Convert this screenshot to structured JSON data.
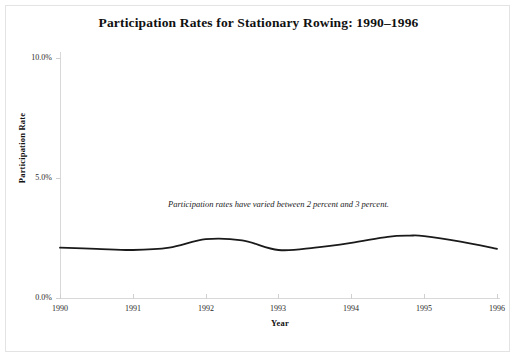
{
  "chart_data": {
    "type": "line",
    "title": "Participation Rates for Stationary Rowing: 1990–1996",
    "xlabel": "Year",
    "ylabel": "Participation Rate",
    "xlim": [
      1990,
      1996
    ],
    "ylim": [
      0,
      10
    ],
    "grid": false,
    "legend": null,
    "x_tick_labels": [
      "1990",
      "1991",
      "1992",
      "1993",
      "1994",
      "1995",
      "1996"
    ],
    "y_tick_labels": [
      "0.0%",
      "5.0%",
      "10.0%"
    ],
    "y_tick_values": [
      0,
      5,
      10
    ],
    "annotations": [
      {
        "text": "Participation rates have varied between 2 percent and 3 percent.",
        "x": 1993,
        "y": 4.1,
        "style": "italic"
      }
    ],
    "series": [
      {
        "name": "Stationary rowing participation rate",
        "units": "percent",
        "line_color": "#1a1a1a",
        "line_width": 1.8,
        "x": [
          1990,
          1990.5,
          1991,
          1991.5,
          1992,
          1992.5,
          1993,
          1993.5,
          1994,
          1994.5,
          1994.8,
          1995,
          1995.5,
          1996
        ],
        "values": [
          2.1,
          2.05,
          2.0,
          2.1,
          2.45,
          2.4,
          2.0,
          2.1,
          2.3,
          2.55,
          2.6,
          2.58,
          2.35,
          2.05
        ]
      }
    ]
  },
  "page": {
    "title": "Participation Rates for Stationary Rowing: 1990–1996",
    "xlabel": "Year",
    "ylabel": "Participation Rate",
    "annotation": "Participation rates have varied between 2 percent and 3 percent.",
    "ylabels": {
      "t0": "0.0%",
      "t1": "5.0%",
      "t2": "10.0%"
    },
    "xlabels": {
      "t0": "1990",
      "t1": "1991",
      "t2": "1992",
      "t3": "1993",
      "t4": "1994",
      "t5": "1995",
      "t6": "1996"
    }
  }
}
